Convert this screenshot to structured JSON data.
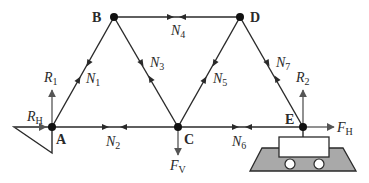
{
  "colors": {
    "member": "#2a2a2a",
    "force": "#555555",
    "support_fill": "#a9a9a9",
    "text": "#2a2a2a"
  },
  "nodes": [
    {
      "id": "A",
      "label": "A",
      "x": 52,
      "y": 127
    },
    {
      "id": "B",
      "label": "B",
      "x": 114,
      "y": 17
    },
    {
      "id": "C",
      "label": "C",
      "x": 178,
      "y": 127
    },
    {
      "id": "D",
      "label": "D",
      "x": 240,
      "y": 17
    },
    {
      "id": "E",
      "label": "E",
      "x": 303,
      "y": 127
    }
  ],
  "members": [
    {
      "id": "N1",
      "name": "N",
      "sub": "1",
      "from": "A",
      "to": "B"
    },
    {
      "id": "N2",
      "name": "N",
      "sub": "2",
      "from": "A",
      "to": "C"
    },
    {
      "id": "N3",
      "name": "N",
      "sub": "3",
      "from": "B",
      "to": "C"
    },
    {
      "id": "N4",
      "name": "N",
      "sub": "4",
      "from": "B",
      "to": "D"
    },
    {
      "id": "N5",
      "name": "N",
      "sub": "5",
      "from": "C",
      "to": "D"
    },
    {
      "id": "N6",
      "name": "N",
      "sub": "6",
      "from": "C",
      "to": "E"
    },
    {
      "id": "N7",
      "name": "N",
      "sub": "7",
      "from": "D",
      "to": "E"
    }
  ],
  "forces": {
    "R1": {
      "name": "R",
      "sub": "1",
      "direction": "up",
      "at": "A"
    },
    "RH": {
      "name": "R",
      "sub": "H",
      "direction": "right",
      "at": "A"
    },
    "FV": {
      "name": "F",
      "sub": "V",
      "direction": "down",
      "at": "C"
    },
    "R2": {
      "name": "R",
      "sub": "2",
      "direction": "up",
      "at": "E"
    },
    "FH": {
      "name": "F",
      "sub": "H",
      "direction": "right",
      "at": "E"
    }
  },
  "supports": {
    "A": "pin (fixed triangle)",
    "E": "roller"
  }
}
